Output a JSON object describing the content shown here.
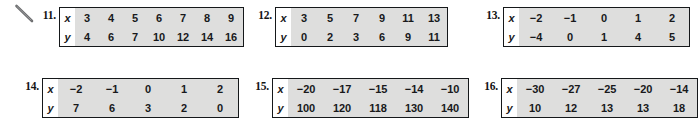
{
  "page": {
    "background_color": "#ffffff",
    "table_fill_color": "#dededd",
    "table_border_color": "#15181a",
    "text_color": "#18191b"
  },
  "annotation": {
    "name": "pencil-stroke-mark",
    "description": "handwritten diagonal pencil stroke"
  },
  "exercises": [
    {
      "number": "11.",
      "row_labels": [
        "x",
        "y"
      ],
      "x": [
        "3",
        "4",
        "5",
        "6",
        "7",
        "8",
        "9"
      ],
      "y": [
        "4",
        "6",
        "7",
        "10",
        "12",
        "14",
        "16"
      ]
    },
    {
      "number": "12.",
      "row_labels": [
        "x",
        "y"
      ],
      "x": [
        "3",
        "5",
        "7",
        "9",
        "11",
        "13"
      ],
      "y": [
        "0",
        "2",
        "3",
        "6",
        "9",
        "11"
      ]
    },
    {
      "number": "13.",
      "row_labels": [
        "x",
        "y"
      ],
      "x": [
        "−2",
        "−1",
        "0",
        "1",
        "2"
      ],
      "y": [
        "−4",
        "0",
        "1",
        "4",
        "5"
      ]
    },
    {
      "number": "14.",
      "row_labels": [
        "x",
        "y"
      ],
      "x": [
        "−2",
        "−1",
        "0",
        "1",
        "2"
      ],
      "y": [
        "7",
        "6",
        "3",
        "2",
        "0"
      ]
    },
    {
      "number": "15.",
      "row_labels": [
        "x",
        "y"
      ],
      "x": [
        "−20",
        "−17",
        "−15",
        "−14",
        "−10"
      ],
      "y": [
        "100",
        "120",
        "118",
        "130",
        "140"
      ]
    },
    {
      "number": "16.",
      "row_labels": [
        "x",
        "y"
      ],
      "x": [
        "−30",
        "−27",
        "−25",
        "−20",
        "−14"
      ],
      "y": [
        "10",
        "12",
        "13",
        "13",
        "18"
      ]
    }
  ]
}
